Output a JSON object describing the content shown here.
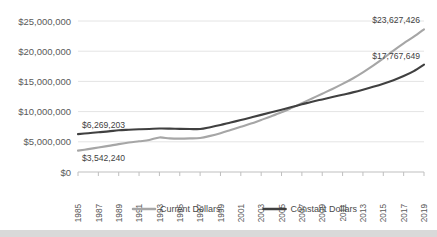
{
  "chart_data": {
    "type": "line",
    "title": "",
    "xlabel": "",
    "ylabel": "",
    "ylim": [
      0,
      25000000
    ],
    "grid": true,
    "legend_position": "bottom",
    "x": [
      1985,
      1986,
      1987,
      1988,
      1989,
      1990,
      1991,
      1992,
      1993,
      1994,
      1995,
      1996,
      1997,
      1998,
      1999,
      2000,
      2001,
      2002,
      2003,
      2004,
      2005,
      2006,
      2007,
      2008,
      2009,
      2010,
      2011,
      2012,
      2013,
      2014,
      2015,
      2016,
      2017,
      2018,
      2019
    ],
    "xtick_labels": [
      "1985",
      "1987",
      "1989",
      "1991",
      "1993",
      "1995",
      "1997",
      "1999",
      "2001",
      "2003",
      "2005",
      "2007",
      "2009",
      "2011",
      "2013",
      "2015",
      "2017",
      "2019"
    ],
    "ytick_labels": [
      "$25,000,000",
      "$20,000,000",
      "$15,000,000",
      "$10,000,000",
      "$5,000,000",
      "$0"
    ],
    "ytick_values": [
      25000000,
      20000000,
      15000000,
      10000000,
      5000000,
      0
    ],
    "series": [
      {
        "name": "Current Dollars",
        "color": "#a6a6a6",
        "values": [
          3542240,
          3790000,
          4060000,
          4330000,
          4620000,
          4880000,
          5080000,
          5290000,
          5720000,
          5560000,
          5520000,
          5560000,
          5640000,
          5980000,
          6420000,
          6950000,
          7480000,
          8020000,
          8620000,
          9230000,
          9880000,
          10620000,
          11390000,
          12180000,
          12960000,
          13740000,
          14580000,
          15480000,
          16500000,
          17600000,
          18800000,
          20100000,
          21300000,
          22400000,
          23627426
        ]
      },
      {
        "name": "Constant Dollars",
        "color": "#404040",
        "values": [
          6269203,
          6420000,
          6580000,
          6720000,
          6900000,
          6990000,
          7070000,
          7120000,
          7190000,
          7180000,
          7140000,
          7120000,
          7110000,
          7420000,
          7780000,
          8200000,
          8600000,
          9030000,
          9460000,
          9890000,
          10320000,
          10760000,
          11200000,
          11640000,
          12020000,
          12400000,
          12790000,
          13180000,
          13620000,
          14110000,
          14630000,
          15200000,
          15880000,
          16700000,
          17767649
        ]
      }
    ],
    "annotations": [
      {
        "text": "$3,542,240",
        "series": "Current Dollars",
        "x": 1985,
        "value": 3542240
      },
      {
        "text": "$23,627,426",
        "series": "Current Dollars",
        "x": 2019,
        "value": 23627426
      },
      {
        "text": "$6,269,203",
        "series": "Constant Dollars",
        "x": 1985,
        "value": 6269203
      },
      {
        "text": "$17,767,649",
        "series": "Constant Dollars",
        "x": 2019,
        "value": 17767649
      }
    ],
    "legend": [
      {
        "label": "Current Dollars",
        "color": "#a6a6a6"
      },
      {
        "label": "Constant Dollars",
        "color": "#404040"
      }
    ]
  }
}
